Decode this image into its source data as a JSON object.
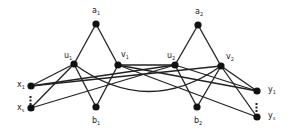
{
  "diagram": {
    "type": "graph",
    "nodes": [
      {
        "id": "a1",
        "label": "a",
        "sub": "1",
        "x": 96,
        "y": 24,
        "lx": 92,
        "ly": 13
      },
      {
        "id": "u1",
        "label": "u",
        "sub": "1",
        "x": 74,
        "y": 64,
        "lx": 64,
        "ly": 58
      },
      {
        "id": "v1",
        "label": "v",
        "sub": "1",
        "x": 118,
        "y": 65,
        "lx": 121,
        "ly": 57
      },
      {
        "id": "b1",
        "label": "b",
        "sub": "1",
        "x": 96,
        "y": 107,
        "lx": 92,
        "ly": 123
      },
      {
        "id": "a2",
        "label": "a",
        "sub": "2",
        "x": 198,
        "y": 25,
        "lx": 195,
        "ly": 14
      },
      {
        "id": "u2",
        "label": "u",
        "sub": "2",
        "x": 175,
        "y": 65,
        "lx": 167,
        "ly": 58
      },
      {
        "id": "v2",
        "label": "v",
        "sub": "2",
        "x": 221,
        "y": 66,
        "lx": 226,
        "ly": 59
      },
      {
        "id": "b2",
        "label": "b",
        "sub": "2",
        "x": 197,
        "y": 107,
        "lx": 194,
        "ly": 123
      },
      {
        "id": "x1",
        "label": "x",
        "sub": "1",
        "x": 31,
        "y": 86,
        "lx": 17,
        "ly": 87
      },
      {
        "id": "x2",
        "label": "x",
        "sub": "s",
        "x": 31,
        "y": 108,
        "lx": 17,
        "ly": 110
      },
      {
        "id": "y1",
        "label": "y",
        "sub": "1",
        "x": 257,
        "y": 91,
        "lx": 268,
        "ly": 92
      },
      {
        "id": "y2",
        "label": "y",
        "sub": "s",
        "x": 257,
        "y": 117,
        "lx": 268,
        "ly": 118
      }
    ],
    "edges": [
      [
        "a1",
        "u1"
      ],
      [
        "a1",
        "v1"
      ],
      [
        "a2",
        "u2"
      ],
      [
        "a2",
        "v2"
      ],
      [
        "u1",
        "b1"
      ],
      [
        "v1",
        "b1"
      ],
      [
        "u2",
        "b2"
      ],
      [
        "v2",
        "b2"
      ],
      [
        "x1",
        "u1"
      ],
      [
        "x1",
        "v2"
      ],
      [
        "x2",
        "u1"
      ],
      [
        "x2",
        "u2"
      ],
      [
        "v1",
        "u2"
      ],
      [
        "v1",
        "y1"
      ],
      [
        "v1",
        "y2"
      ],
      [
        "x1",
        "u2"
      ],
      [
        "v2",
        "y1"
      ],
      [
        "v2",
        "y2"
      ],
      [
        "u2",
        "y1"
      ]
    ],
    "curved_edges": [
      {
        "from": "u1",
        "to": "v2",
        "ctrl_y": 118
      }
    ],
    "ellipses": [
      {
        "between": [
          "x1",
          "x2"
        ],
        "glyph": "⋮",
        "x": 28,
        "y": 101
      },
      {
        "between": [
          "y1",
          "y2"
        ],
        "glyph": "⋮",
        "x": 254,
        "y": 108
      }
    ]
  }
}
